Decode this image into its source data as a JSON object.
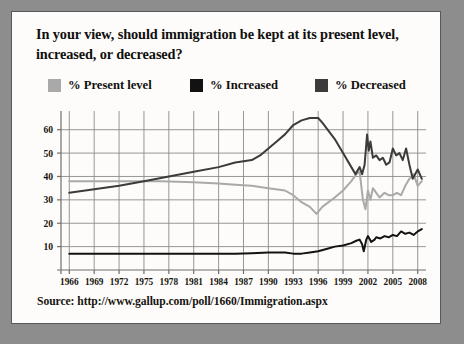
{
  "card": {
    "title": "In your view, should immigration be kept at its present level, increased, or decreased?",
    "source": "Source: http://www.gallup.com/poll/1660/Immigration.aspx"
  },
  "colors": {
    "page_background": "#8d8d8d",
    "card_background": "#fdfcfa",
    "card_border": "#55595c",
    "grid": "#8b8b8b",
    "axis": "#6f6f6f",
    "present_level": "#a9a9a9",
    "increased": "#121212",
    "decreased": "#3b3b3b",
    "text": "#17150f"
  },
  "chart_data": {
    "type": "line",
    "title": "In your view, should immigration be kept at its present level, increased, or decreased?",
    "xlabel": "",
    "ylabel": "",
    "xlim": [
      1965,
      2009
    ],
    "ylim": [
      0,
      68
    ],
    "yticks": [
      10,
      20,
      30,
      40,
      50,
      60
    ],
    "xticks": [
      1966,
      1969,
      1972,
      1975,
      1978,
      1981,
      1984,
      1987,
      1990,
      1993,
      1996,
      1999,
      2002,
      2005,
      2008
    ],
    "grid": true,
    "legend_position": "top",
    "series": [
      {
        "name": "% Present level",
        "color": "#a9a9a9",
        "points": [
          [
            1966,
            38
          ],
          [
            1969,
            38
          ],
          [
            1972,
            38
          ],
          [
            1975,
            38
          ],
          [
            1977,
            38
          ],
          [
            1981,
            37.5
          ],
          [
            1984,
            37
          ],
          [
            1986,
            36.5
          ],
          [
            1988,
            36
          ],
          [
            1990,
            35
          ],
          [
            1992,
            34
          ],
          [
            1993,
            32
          ],
          [
            1994,
            29
          ],
          [
            1995,
            27
          ],
          [
            1995.8,
            24
          ],
          [
            1996.5,
            27
          ],
          [
            1998,
            31
          ],
          [
            1999,
            34
          ],
          [
            2000,
            38
          ],
          [
            2000.6,
            41
          ],
          [
            2001,
            42
          ],
          [
            2001.4,
            30
          ],
          [
            2001.7,
            26
          ],
          [
            2002,
            34
          ],
          [
            2002.3,
            30
          ],
          [
            2002.6,
            35
          ],
          [
            2003,
            33
          ],
          [
            2003.4,
            31
          ],
          [
            2004,
            33
          ],
          [
            2004.5,
            32
          ],
          [
            2005,
            32
          ],
          [
            2005.5,
            33
          ],
          [
            2006,
            32
          ],
          [
            2006.5,
            36
          ],
          [
            2007,
            39
          ],
          [
            2007.5,
            41
          ],
          [
            2008,
            36
          ],
          [
            2008.5,
            38
          ]
        ]
      },
      {
        "name": "% Increased",
        "color": "#121212",
        "points": [
          [
            1966,
            7
          ],
          [
            1970,
            7
          ],
          [
            1975,
            7
          ],
          [
            1980,
            7
          ],
          [
            1984,
            7
          ],
          [
            1986,
            7
          ],
          [
            1988,
            7.2
          ],
          [
            1990,
            7.5
          ],
          [
            1992,
            7.5
          ],
          [
            1993,
            7
          ],
          [
            1994,
            7
          ],
          [
            1995,
            7.5
          ],
          [
            1996,
            8
          ],
          [
            1997,
            9
          ],
          [
            1998,
            10
          ],
          [
            1999,
            10.5
          ],
          [
            2000,
            11.5
          ],
          [
            2000.6,
            12.5
          ],
          [
            2001,
            13
          ],
          [
            2001.3,
            11
          ],
          [
            2001.5,
            8
          ],
          [
            2001.8,
            13
          ],
          [
            2002,
            14.5
          ],
          [
            2002.4,
            12
          ],
          [
            2002.8,
            13
          ],
          [
            2003,
            14
          ],
          [
            2003.5,
            13.5
          ],
          [
            2004,
            14.5
          ],
          [
            2004.5,
            14
          ],
          [
            2005,
            15
          ],
          [
            2005.5,
            14.5
          ],
          [
            2006,
            16.5
          ],
          [
            2006.5,
            15.5
          ],
          [
            2007,
            16
          ],
          [
            2007.5,
            15
          ],
          [
            2008,
            16.5
          ],
          [
            2008.5,
            17.5
          ]
        ]
      },
      {
        "name": "% Decreased",
        "color": "#3b3b3b",
        "points": [
          [
            1966,
            33
          ],
          [
            1969,
            34.5
          ],
          [
            1972,
            36
          ],
          [
            1975,
            38
          ],
          [
            1978,
            40
          ],
          [
            1981,
            42
          ],
          [
            1984,
            44
          ],
          [
            1986,
            46
          ],
          [
            1988,
            47
          ],
          [
            1989,
            49
          ],
          [
            1990,
            52
          ],
          [
            1991,
            55
          ],
          [
            1992,
            58
          ],
          [
            1993,
            62
          ],
          [
            1994,
            64
          ],
          [
            1995,
            65
          ],
          [
            1996,
            65
          ],
          [
            1996.5,
            63
          ],
          [
            1998,
            56
          ],
          [
            1999,
            50
          ],
          [
            2000,
            44
          ],
          [
            2000.5,
            41
          ],
          [
            2001,
            44
          ],
          [
            2001.3,
            41
          ],
          [
            2001.6,
            45
          ],
          [
            2001.9,
            58
          ],
          [
            2002.1,
            51
          ],
          [
            2002.3,
            55
          ],
          [
            2002.6,
            48
          ],
          [
            2003,
            49
          ],
          [
            2003.4,
            47
          ],
          [
            2003.8,
            48
          ],
          [
            2004.2,
            45
          ],
          [
            2004.6,
            46
          ],
          [
            2005,
            52
          ],
          [
            2005.4,
            49
          ],
          [
            2005.8,
            50
          ],
          [
            2006.2,
            47
          ],
          [
            2006.6,
            52
          ],
          [
            2007,
            45
          ],
          [
            2007.4,
            39
          ],
          [
            2008,
            43
          ],
          [
            2008.5,
            39
          ]
        ]
      }
    ]
  }
}
